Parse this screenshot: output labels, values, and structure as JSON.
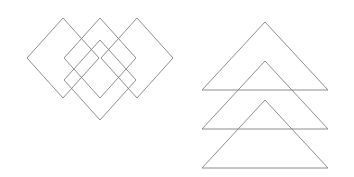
{
  "figure": {
    "title": "Geometric line drawing of overlapping diamonds and triangles",
    "canvas": {
      "width": 354,
      "height": 177,
      "background_color": "#ffffff"
    },
    "style": {
      "stroke_color": "#808080",
      "stroke_width": 0.9,
      "fill": "none"
    },
    "groups": [
      {
        "name": "diamond-group",
        "label": "Overlapping diamonds",
        "shape_type": "diamond",
        "count": 4,
        "shapes": [
          {
            "name": "diamond-1",
            "label": "Top-left diamond",
            "center_x": 63,
            "center_y": 58,
            "half_width": 36,
            "half_height": 40,
            "points": "63,18 99,58 63,98 27,58"
          },
          {
            "name": "diamond-2",
            "label": "Top-middle diamond",
            "center_x": 100,
            "center_y": 58,
            "half_width": 36,
            "half_height": 40,
            "points": "100,18 136,58 100,98 64,58"
          },
          {
            "name": "diamond-3",
            "label": "Top-right diamond",
            "center_x": 137,
            "center_y": 58,
            "half_width": 36,
            "half_height": 40,
            "points": "137,18 173,58 137,98 101,58"
          },
          {
            "name": "diamond-4",
            "label": "Lower-center offset diamond",
            "center_x": 100,
            "center_y": 80,
            "half_width": 36,
            "half_height": 40,
            "points": "100,40 136,80 100,120 64,80"
          }
        ]
      },
      {
        "name": "triangle-group",
        "label": "Stacked overlapping triangles",
        "shape_type": "triangle",
        "count": 3,
        "shapes": [
          {
            "name": "triangle-1",
            "label": "Top triangle",
            "apex_x": 265,
            "apex_y": 22,
            "base_y": 90,
            "base_left_x": 202,
            "base_right_x": 328,
            "points": "265,22 328,90 202,90"
          },
          {
            "name": "triangle-2",
            "label": "Middle triangle",
            "apex_x": 265,
            "apex_y": 61,
            "base_y": 129,
            "base_left_x": 202,
            "base_right_x": 328,
            "points": "265,61 328,129 202,129"
          },
          {
            "name": "triangle-3",
            "label": "Bottom triangle",
            "apex_x": 265,
            "apex_y": 100,
            "base_y": 168,
            "base_left_x": 202,
            "base_right_x": 328,
            "points": "265,100 328,168 202,168"
          }
        ]
      }
    ]
  }
}
